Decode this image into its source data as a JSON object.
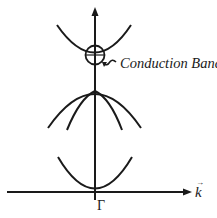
{
  "diagram": {
    "type": "band-structure",
    "annotation": "Conduction Band",
    "x_axis_label": "k",
    "x_axis_vector_mark": "→",
    "origin_label": "Γ",
    "colors": {
      "line": "#1a1a1a",
      "background": "#ffffff"
    }
  }
}
